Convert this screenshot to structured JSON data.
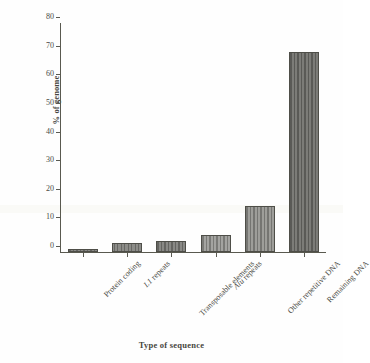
{
  "chart_data": {
    "type": "bar",
    "title": "",
    "xlabel": "Type of sequence",
    "ylabel": "% of genome",
    "categories": [
      "Protein coding",
      "L1 repeats",
      "Transposable elements",
      "Alu repeats",
      "Other repetitive DNA",
      "Remaining DNA"
    ],
    "categories_italic_prefix": [
      "",
      "L1",
      "",
      "Alu",
      "",
      ""
    ],
    "values": [
      1,
      3,
      4,
      6,
      16,
      70
    ],
    "ylim": [
      0,
      80
    ],
    "ytick_labels": [
      "0",
      "10",
      "20",
      "30",
      "40",
      "50",
      "60",
      "70",
      "80"
    ],
    "ytick_values": [
      0,
      10,
      20,
      30,
      40,
      50,
      60,
      70,
      80
    ],
    "grid": false,
    "legend": false,
    "bar_fill_color": "#8e8e8a",
    "bar_edge_color": "#4e4e48",
    "axis_color": "#59594f",
    "text_color": "#4a4a44"
  },
  "axis": {
    "y_label": "% of genome",
    "x_label": "Type of sequence"
  }
}
